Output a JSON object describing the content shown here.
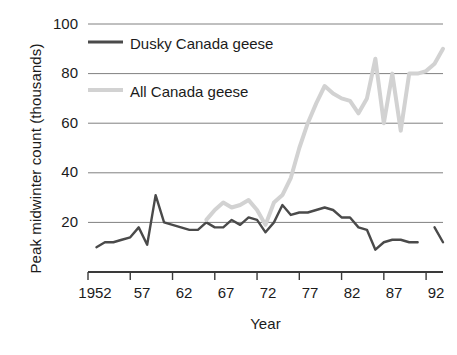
{
  "chart_data": {
    "type": "line",
    "title": "",
    "xlabel": "Year",
    "ylabel": "Peak midwinter count (thousands)",
    "xlim": [
      1952,
      1994
    ],
    "ylim": [
      0,
      100
    ],
    "grid": true,
    "legend_position": "upper-left-inside",
    "y_ticks": [
      20,
      40,
      60,
      80,
      100
    ],
    "y_tick_labels": [
      "20",
      "40",
      "60",
      "80",
      "100"
    ],
    "x_ticks": [
      1952,
      1957,
      1962,
      1967,
      1972,
      1977,
      1982,
      1987,
      1992
    ],
    "x_tick_labels": [
      "1952",
      "57",
      "62",
      "67",
      "72",
      "77",
      "82",
      "87",
      "92"
    ],
    "series": [
      {
        "name": "Dusky Canada geese",
        "color": "#4a4a4a",
        "x": [
          1953,
          1954,
          1955,
          1956,
          1957,
          1958,
          1959,
          1960,
          1961,
          1962,
          1963,
          1964,
          1965,
          1966,
          1967,
          1968,
          1969,
          1970,
          1971,
          1972,
          1973,
          1974,
          1975,
          1976,
          1977,
          1978,
          1979,
          1980,
          1981,
          1982,
          1983,
          1984,
          1985,
          1986,
          1987,
          1988,
          1989,
          1990,
          1991,
          1992,
          1993,
          1994
        ],
        "values": [
          10,
          12,
          12,
          13,
          14,
          18,
          11,
          31,
          20,
          19,
          18,
          17,
          17,
          20,
          18,
          18,
          21,
          19,
          22,
          21,
          16,
          20,
          27,
          23,
          24,
          24,
          25,
          26,
          25,
          22,
          22,
          18,
          17,
          9,
          12,
          13,
          13,
          12,
          12,
          null,
          18,
          12
        ]
      },
      {
        "name": "All Canada geese",
        "color": "#d2d2d2",
        "x": [
          1966,
          1967,
          1968,
          1969,
          1970,
          1971,
          1972,
          1973,
          1974,
          1975,
          1976,
          1977,
          1978,
          1979,
          1980,
          1981,
          1982,
          1983,
          1984,
          1985,
          1986,
          1987,
          1988,
          1989,
          1990,
          1991,
          1992,
          1993,
          1994
        ],
        "values": [
          21,
          25,
          28,
          26,
          27,
          29,
          25,
          19,
          28,
          31,
          38,
          50,
          60,
          68,
          75,
          72,
          70,
          69,
          64,
          70,
          86,
          60,
          80,
          57,
          80,
          80,
          81,
          84,
          90
        ]
      }
    ],
    "annotations": []
  },
  "legend": {
    "entries": [
      {
        "label": "Dusky Canada geese",
        "swatch": "legend-line-dusky"
      },
      {
        "label": "All Canada geese",
        "swatch": "legend-line-all"
      }
    ]
  },
  "axes": {
    "y_title": "Peak midwinter count (thousands)",
    "x_title": "Year",
    "y_labels": {
      "t100": "100",
      "t80": "80",
      "t60": "60",
      "t40": "40",
      "t20": "20"
    },
    "x_labels": {
      "t1952": "1952",
      "t57": "57",
      "t62": "62",
      "t67": "67",
      "t72": "72",
      "t77": "77",
      "t82": "82",
      "t87": "87",
      "t92": "92"
    }
  },
  "colors": {
    "dusky": "#4a4a4a",
    "all": "#d2d2d2",
    "grid": "#808080",
    "axis": "#3a3a3a",
    "text": "#1b1b1b",
    "background": "#ffffff"
  }
}
